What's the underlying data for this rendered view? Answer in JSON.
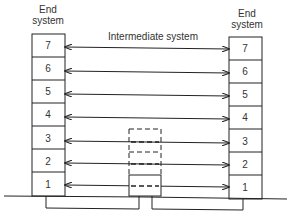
{
  "diagram": {
    "left_system_label": "End system",
    "right_system_label": "End system",
    "intermediate_label": "Intermediate system",
    "layers": [
      "7",
      "6",
      "5",
      "4",
      "3",
      "2",
      "1"
    ],
    "intermediate_layers": [
      "3",
      "2",
      "1"
    ]
  }
}
